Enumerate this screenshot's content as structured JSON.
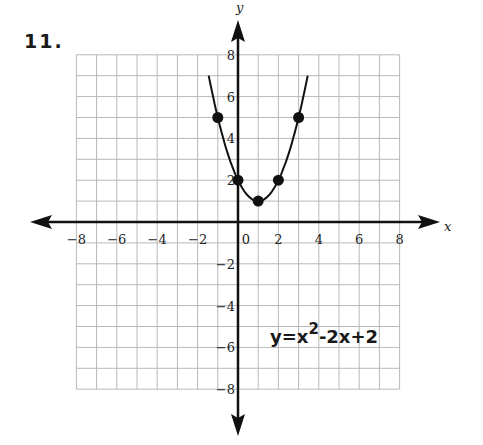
{
  "problem_number": "11.",
  "equation": {
    "lhs": "y=x",
    "exp": "2",
    "rest": "-2x+2"
  },
  "chart_data": {
    "type": "line",
    "title": "11.",
    "xlabel": "x",
    "ylabel": "y",
    "xlim": [
      -8,
      8
    ],
    "ylim": [
      -8,
      8
    ],
    "grid": true,
    "x_tick_labels": [
      "-8",
      "-6",
      "-4",
      "-2",
      "0",
      "2",
      "4",
      "6",
      "8"
    ],
    "y_tick_labels": [
      "8",
      "6",
      "4",
      "2",
      "-2",
      "-4",
      "-6",
      "-8"
    ],
    "annotation": "y=x^2-2x+2",
    "series": [
      {
        "name": "y=x^2-2x+2",
        "type": "curve",
        "function": "x^2-2x+2",
        "x_range": [
          -1.45,
          3.45
        ]
      }
    ],
    "points": [
      {
        "x": -1,
        "y": 5
      },
      {
        "x": 0,
        "y": 2
      },
      {
        "x": 1,
        "y": 1
      },
      {
        "x": 2,
        "y": 2
      },
      {
        "x": 3,
        "y": 5
      }
    ]
  }
}
